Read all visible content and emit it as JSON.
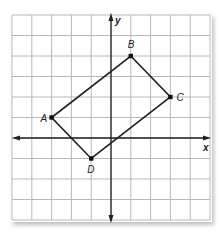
{
  "figure": {
    "type": "coordinate-plane",
    "grid": {
      "x_min": -5,
      "x_max": 5,
      "y_min": -4,
      "y_max": 6,
      "step": 1
    },
    "axes": {
      "x_label": "x",
      "y_label": "y"
    },
    "points": [
      {
        "label": "A",
        "x": -3,
        "y": 1
      },
      {
        "label": "B",
        "x": 1,
        "y": 4
      },
      {
        "label": "C",
        "x": 3,
        "y": 2
      },
      {
        "label": "D",
        "x": -1,
        "y": -1
      }
    ],
    "polygon": [
      "A",
      "B",
      "C",
      "D"
    ],
    "colors": {
      "grid": "#b8b8b8",
      "axis": "#222222",
      "shape": "#222222"
    }
  },
  "chart_data": {
    "type": "scatter",
    "title": "",
    "xlabel": "x",
    "ylabel": "y",
    "xlim": [
      -5,
      5
    ],
    "ylim": [
      -4,
      6
    ],
    "grid": true,
    "series": [
      {
        "name": "ABCD",
        "points": [
          {
            "label": "A",
            "x": -3,
            "y": 1
          },
          {
            "label": "B",
            "x": 1,
            "y": 4
          },
          {
            "label": "C",
            "x": 3,
            "y": 2
          },
          {
            "label": "D",
            "x": -1,
            "y": -1
          }
        ],
        "closed": true
      }
    ]
  }
}
